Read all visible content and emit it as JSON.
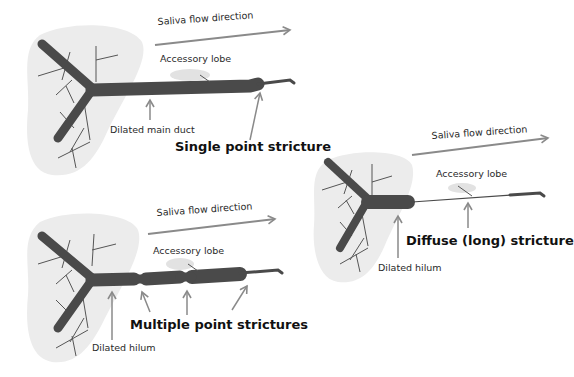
{
  "colors": {
    "gland_fill": "#ececec",
    "duct": "#4a4a4a",
    "branch": "#555555",
    "arrow": "#8a8a8a",
    "lobe": "#e2e2e2",
    "text": "#2a2a2a"
  },
  "panels": [
    {
      "id": "single",
      "title": "Single point stricture",
      "flow_label": "Saliva flow direction",
      "lobe_label": "Accessory lobe",
      "annotation": "Dilated main duct"
    },
    {
      "id": "multiple",
      "title": "Multiple point strictures",
      "flow_label": "Saliva flow direction",
      "lobe_label": "Accessory lobe",
      "annotation": "Dilated hilum"
    },
    {
      "id": "diffuse",
      "title": "Diffuse (long) stricture",
      "flow_label": "Saliva flow direction",
      "lobe_label": "Accessory lobe",
      "annotation": "Dilated hilum"
    }
  ]
}
